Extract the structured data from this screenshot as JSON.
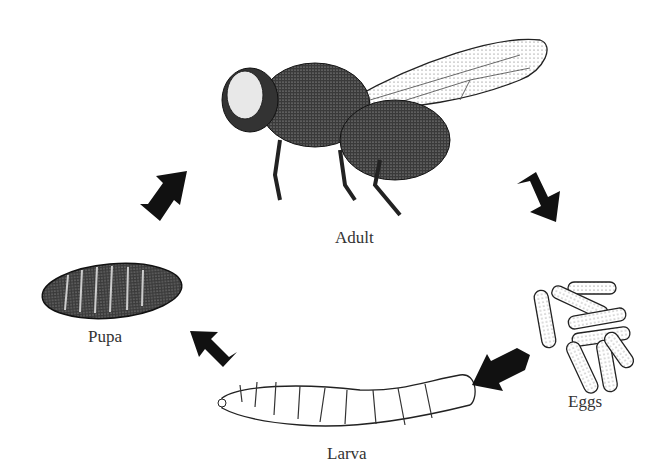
{
  "diagram": {
    "type": "life-cycle",
    "stages": [
      {
        "id": "adult",
        "label": "Adult"
      },
      {
        "id": "eggs",
        "label": "Eggs"
      },
      {
        "id": "larva",
        "label": "Larva"
      },
      {
        "id": "pupa",
        "label": "Pupa"
      }
    ],
    "arrows": [
      {
        "from": "adult",
        "to": "eggs"
      },
      {
        "from": "eggs",
        "to": "larva"
      },
      {
        "from": "larva",
        "to": "pupa"
      },
      {
        "from": "pupa",
        "to": "adult"
      }
    ],
    "colors": {
      "arrow": "#111111",
      "ink": "#1a1a1a",
      "label": "#333333"
    }
  }
}
